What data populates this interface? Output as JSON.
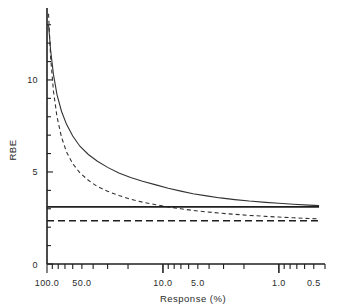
{
  "chart_data": {
    "type": "line",
    "title": "",
    "xlabel": "Response (%)",
    "ylabel": "RBE",
    "x_scale": "log-reversed",
    "xlim": [
      100.0,
      0.4
    ],
    "ylim": [
      0,
      13.8
    ],
    "grid": false,
    "legend": "none",
    "x_tick_labels": [
      "100.0",
      "50.0",
      "10.0",
      "5.0",
      "1.0",
      "0.5"
    ],
    "x_tick_values": [
      100.0,
      50.0,
      10.0,
      5.0,
      1.0,
      0.5
    ],
    "y_tick_labels": [
      "0",
      "5",
      "10"
    ],
    "y_tick_values": [
      0,
      5,
      10
    ],
    "y_minor_step": 1,
    "series": [
      {
        "name": "solid-curve",
        "style": "solid",
        "color": "#333333",
        "x": [
          97.0,
          93.0,
          88.0,
          82.0,
          75.0,
          68.0,
          60.0,
          52.0,
          44.0,
          37.0,
          30.0,
          24.0,
          19.0,
          15.0,
          11.5,
          9.0,
          7.0,
          5.5,
          4.2,
          3.2,
          2.4,
          1.8,
          1.3,
          1.0,
          0.75,
          0.55,
          0.45
        ],
        "y": [
          13.0,
          11.6,
          10.3,
          9.2,
          8.3,
          7.6,
          6.95,
          6.4,
          5.95,
          5.6,
          5.25,
          4.95,
          4.7,
          4.5,
          4.3,
          4.12,
          3.96,
          3.82,
          3.7,
          3.59,
          3.5,
          3.42,
          3.35,
          3.3,
          3.25,
          3.2,
          3.17
        ]
      },
      {
        "name": "dashed-curve",
        "style": "dashed",
        "color": "#333333",
        "x": [
          97.0,
          93.0,
          88.0,
          82.0,
          75.0,
          68.0,
          60.0,
          52.0,
          44.0,
          37.0,
          30.0,
          24.0,
          19.0,
          15.0,
          11.5,
          9.0,
          7.0,
          5.5,
          4.2,
          3.2,
          2.4,
          1.8,
          1.3,
          1.0,
          0.75,
          0.55,
          0.45
        ],
        "y": [
          13.6,
          11.2,
          9.4,
          8.0,
          6.9,
          6.1,
          5.45,
          4.95,
          4.55,
          4.22,
          3.95,
          3.72,
          3.52,
          3.36,
          3.22,
          3.1,
          3.0,
          2.91,
          2.83,
          2.76,
          2.7,
          2.64,
          2.59,
          2.55,
          2.51,
          2.47,
          2.45
        ]
      },
      {
        "name": "solid-asymptote",
        "style": "solid-horizontal",
        "color": "#1f1f1f",
        "value": 3.1,
        "x_from": 100.0,
        "x_to": 0.45
      },
      {
        "name": "dashed-asymptote",
        "style": "dashed-horizontal",
        "color": "#1f1f1f",
        "value": 2.35,
        "x_from": 100.0,
        "x_to": 0.45
      }
    ]
  }
}
